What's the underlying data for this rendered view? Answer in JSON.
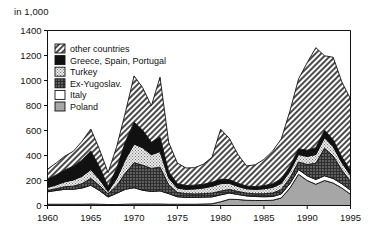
{
  "unit_label": "in 1,000",
  "chart_data": {
    "type": "area",
    "title": "",
    "subtitle": "",
    "xlabel": "",
    "ylabel": "in 1,000",
    "stacked": true,
    "grid": false,
    "legend_position": "top-left-inside",
    "xlim": [
      1960,
      1995
    ],
    "ylim": [
      0,
      1400
    ],
    "xticks": [
      1960,
      1965,
      1970,
      1975,
      1980,
      1985,
      1990,
      1995
    ],
    "xtick_labels": [
      "1960",
      "1965",
      "1970",
      "1975",
      "1980",
      "1985",
      "1990",
      "1995"
    ],
    "yticks": [
      0,
      200,
      400,
      600,
      800,
      1000,
      1200,
      1400
    ],
    "ytick_labels": [
      "0",
      "200",
      "400",
      "600",
      "800",
      "1000",
      "1200",
      "1400"
    ],
    "x": [
      1960,
      1961,
      1962,
      1963,
      1964,
      1965,
      1966,
      1967,
      1968,
      1969,
      1970,
      1971,
      1972,
      1973,
      1974,
      1975,
      1976,
      1977,
      1978,
      1979,
      1980,
      1981,
      1982,
      1983,
      1984,
      1985,
      1986,
      1987,
      1988,
      1989,
      1990,
      1991,
      1992,
      1993,
      1994,
      1995
    ],
    "series": [
      {
        "name": "Poland",
        "pattern": "solid-gray",
        "color": "#9c9c9c",
        "values": [
          10,
          10,
          10,
          10,
          10,
          12,
          10,
          8,
          8,
          10,
          12,
          12,
          12,
          12,
          10,
          10,
          10,
          10,
          12,
          14,
          30,
          50,
          48,
          42,
          40,
          40,
          42,
          60,
          140,
          250,
          200,
          170,
          200,
          180,
          140,
          90
        ]
      },
      {
        "name": "Italy",
        "pattern": "white",
        "color": "#ffffff",
        "values": [
          100,
          110,
          120,
          120,
          130,
          150,
          110,
          60,
          90,
          120,
          130,
          110,
          100,
          105,
          85,
          60,
          55,
          55,
          55,
          55,
          55,
          50,
          40,
          35,
          32,
          30,
          30,
          32,
          35,
          38,
          38,
          38,
          38,
          36,
          34,
          32
        ]
      },
      {
        "name": "Ex-Yugoslav.",
        "pattern": "dark-crosshatch",
        "color": "#5a5a5a",
        "values": [
          10,
          15,
          20,
          25,
          35,
          55,
          40,
          25,
          60,
          130,
          200,
          200,
          185,
          190,
          70,
          35,
          30,
          28,
          28,
          30,
          30,
          28,
          25,
          22,
          22,
          24,
          28,
          35,
          45,
          60,
          90,
          130,
          220,
          180,
          110,
          70
        ]
      },
      {
        "name": "Turkey",
        "pattern": "light-stipple",
        "color": "#dcdcdc",
        "values": [
          25,
          30,
          40,
          50,
          60,
          70,
          50,
          20,
          60,
          110,
          150,
          140,
          110,
          125,
          55,
          35,
          35,
          40,
          45,
          55,
          60,
          50,
          40,
          35,
          35,
          40,
          45,
          50,
          55,
          60,
          65,
          70,
          85,
          75,
          60,
          50
        ]
      },
      {
        "name": "Greece, Spain, Portugal",
        "pattern": "solid-black",
        "color": "#111111",
        "values": [
          65,
          80,
          95,
          110,
          130,
          150,
          100,
          40,
          80,
          140,
          175,
          140,
          100,
          115,
          50,
          35,
          30,
          30,
          30,
          32,
          35,
          30,
          25,
          22,
          22,
          25,
          30,
          35,
          40,
          45,
          50,
          55,
          60,
          55,
          45,
          40
        ]
      },
      {
        "name": "other countries",
        "pattern": "diagonal-hatch",
        "color": "#707070",
        "values": [
          80,
          95,
          110,
          120,
          150,
          175,
          140,
          110,
          175,
          235,
          370,
          340,
          290,
          480,
          235,
          165,
          140,
          140,
          160,
          200,
          400,
          330,
          230,
          160,
          175,
          210,
          260,
          320,
          440,
          560,
          700,
          800,
          595,
          660,
          600,
          570
        ]
      }
    ],
    "totals_note": "",
    "annotations": []
  },
  "legend": {
    "items": [
      {
        "label": "other countries",
        "pattern": "diagonal-hatch"
      },
      {
        "label": "Greece, Spain, Portugal",
        "pattern": "solid-black"
      },
      {
        "label": "Turkey",
        "pattern": "light-stipple"
      },
      {
        "label": "Ex-Yugoslav.",
        "pattern": "dark-crosshatch"
      },
      {
        "label": "Italy",
        "pattern": "white"
      },
      {
        "label": "Poland",
        "pattern": "solid-gray"
      }
    ]
  }
}
